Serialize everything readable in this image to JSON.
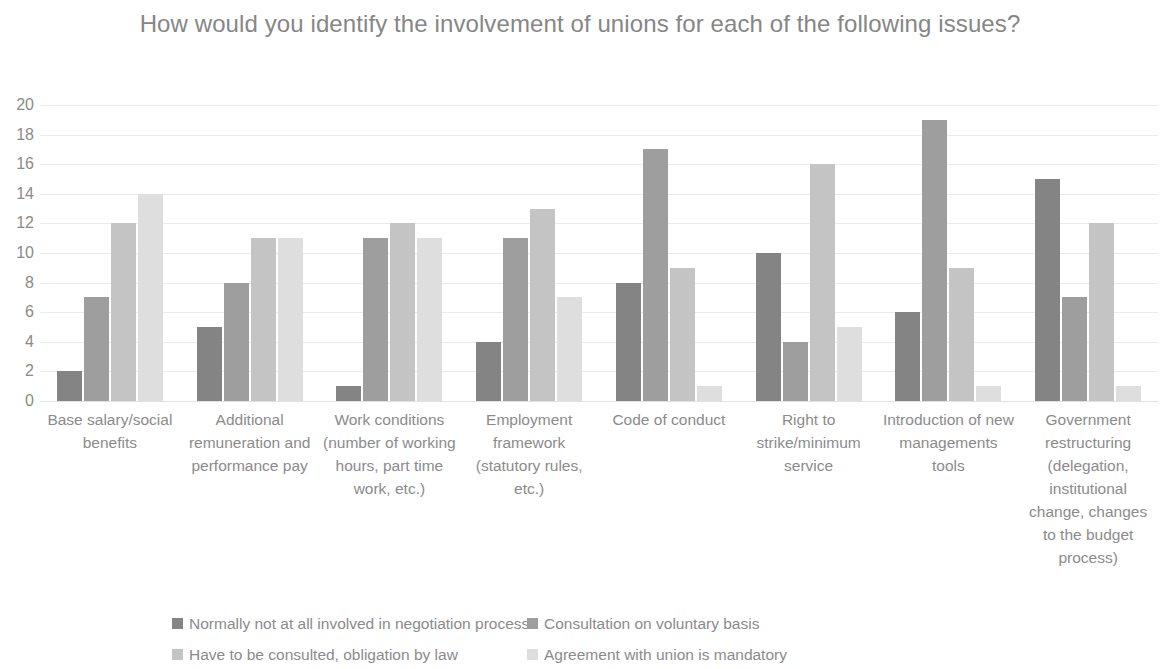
{
  "chart_data": {
    "type": "bar",
    "title": "How would you identify the involvement of unions for each of the following issues?",
    "xlabel": "",
    "ylabel": "",
    "ylim": [
      0,
      20
    ],
    "ytick_step": 2,
    "yticks": [
      20,
      18,
      16,
      14,
      12,
      10,
      8,
      6,
      4,
      2,
      0
    ],
    "grid": true,
    "legend_position": "bottom",
    "categories": [
      "Base salary/social benefits",
      "Additional remuneration and performance pay",
      "Work conditions (number of working hours, part time work, etc.)",
      "Employment framework (statutory rules, etc.)",
      "Code of conduct",
      "Right to strike/minimum service",
      "Introduction of new managements tools",
      "Government restructuring (delegation, institutional change, changes to the budget process)"
    ],
    "series": [
      {
        "name": "Normally not at all involved in negotiation process",
        "color": "#848484",
        "values": [
          2,
          5,
          1,
          4,
          8,
          10,
          6,
          15
        ]
      },
      {
        "name": "Consultation on voluntary basis",
        "color": "#9e9e9e",
        "values": [
          7,
          8,
          11,
          11,
          17,
          4,
          19,
          7
        ]
      },
      {
        "name": "Have to be consulted, obligation by law",
        "color": "#c4c4c4",
        "values": [
          12,
          11,
          12,
          13,
          9,
          16,
          9,
          12
        ]
      },
      {
        "name": "Agreement with union is mandatory",
        "color": "#dedede",
        "values": [
          14,
          11,
          11,
          7,
          1,
          5,
          1,
          1
        ]
      }
    ]
  }
}
